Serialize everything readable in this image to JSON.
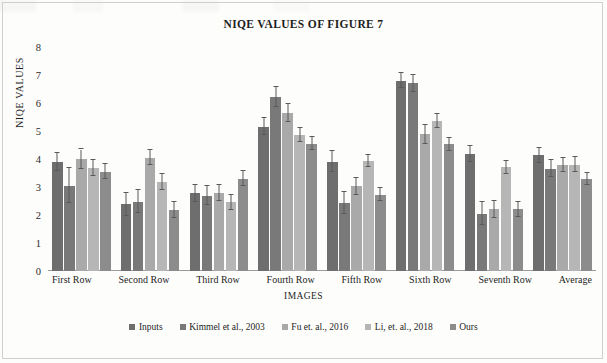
{
  "chart_data": {
    "type": "bar",
    "title": "NIQE VALUES OF FIGURE 7",
    "xlabel": "IMAGES",
    "ylabel": "NIQE VALUES",
    "ylim": [
      0,
      8
    ],
    "yticks": [
      8,
      7,
      6,
      5,
      4,
      3,
      2,
      1,
      0
    ],
    "grid": false,
    "legend_position": "bottom",
    "error_bars": true,
    "categories": [
      "First Row",
      "Second Row",
      "Third Row",
      "Fourth Row",
      "Fifth Row",
      "Sixth Row",
      "Seventh Row",
      "Average"
    ],
    "series": [
      {
        "name": "Inputs",
        "color": "#6e6e6e",
        "values": [
          3.9,
          2.38,
          2.78,
          5.15,
          3.9,
          6.8,
          4.18,
          4.13
        ],
        "errors": [
          0.32,
          0.42,
          0.3,
          0.3,
          0.38,
          0.28,
          0.3,
          0.28
        ]
      },
      {
        "name": "Kimmel et al., 2003",
        "color": "#797979",
        "values": [
          3.05,
          2.48,
          2.68,
          6.2,
          2.43,
          6.7,
          2.05,
          3.65
        ],
        "errors": [
          0.62,
          0.42,
          0.34,
          0.36,
          0.38,
          0.3,
          0.42,
          0.3
        ]
      },
      {
        "name": "Fu et. al., 2016",
        "color": "#a9a9a9",
        "values": [
          4.0,
          4.05,
          2.78,
          5.65,
          3.03,
          4.88,
          2.2,
          3.78
        ],
        "errors": [
          0.34,
          0.26,
          0.28,
          0.32,
          0.3,
          0.34,
          0.3,
          0.26
        ]
      },
      {
        "name": "Li, et. al., 2018",
        "color": "#b6b6b6",
        "values": [
          3.68,
          3.18,
          2.45,
          4.85,
          3.93,
          5.35,
          3.7,
          3.8
        ],
        "errors": [
          0.28,
          0.28,
          0.28,
          0.24,
          0.22,
          0.26,
          0.24,
          0.26
        ]
      },
      {
        "name": "Ours",
        "color": "#8c8c8c",
        "values": [
          3.55,
          2.18,
          3.3,
          4.55,
          2.73,
          4.52,
          2.2,
          3.28
        ],
        "errors": [
          0.28,
          0.28,
          0.26,
          0.22,
          0.24,
          0.22,
          0.28,
          0.22
        ]
      }
    ]
  }
}
